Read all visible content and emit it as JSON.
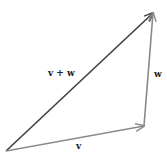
{
  "diagram": {
    "vectors": [
      {
        "id": "v",
        "label": "v",
        "tail": [
          6,
          151
        ],
        "head": [
          144,
          126
        ],
        "color": "#8a8a8a"
      },
      {
        "id": "w",
        "label": "w",
        "tail": [
          144,
          126
        ],
        "head": [
          153,
          13
        ],
        "color": "#8a8a8a"
      },
      {
        "id": "v_plus_w",
        "label": "v + w",
        "tail": [
          6,
          151
        ],
        "head": [
          153,
          13
        ],
        "color": "#404040"
      }
    ],
    "labels": {
      "v": "v",
      "w": "w",
      "v_plus_w": "v + w"
    }
  }
}
